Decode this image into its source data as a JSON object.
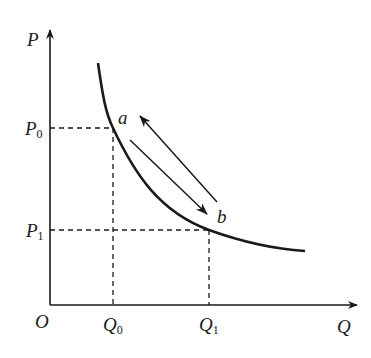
{
  "diagram": {
    "type": "demand-curve",
    "colors": {
      "stroke": "#1a1a1a",
      "background": "#ffffff"
    },
    "axes": {
      "origin_label": "O",
      "y_label": "P",
      "x_label": "Q"
    },
    "price_levels": [
      {
        "name": "P",
        "sub": "0"
      },
      {
        "name": "P",
        "sub": "1"
      }
    ],
    "quantity_levels": [
      {
        "name": "Q",
        "sub": "0"
      },
      {
        "name": "Q",
        "sub": "1"
      }
    ],
    "points": [
      {
        "label": "a",
        "price": "P0",
        "quantity": "Q0"
      },
      {
        "label": "b",
        "price": "P1",
        "quantity": "Q1"
      }
    ],
    "arrows": [
      {
        "from": "a",
        "to": "b",
        "direction": "down-right along curve"
      },
      {
        "from": "b",
        "to": "a",
        "direction": "up-left along curve"
      }
    ]
  }
}
